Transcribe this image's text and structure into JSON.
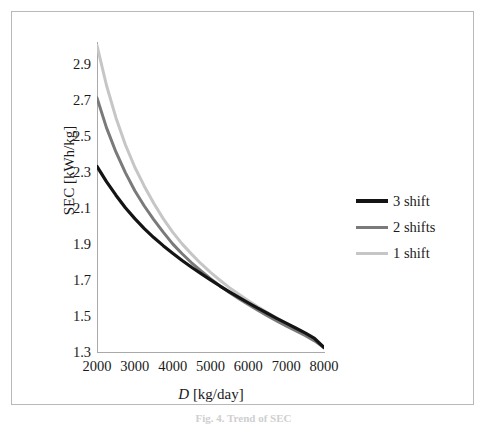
{
  "figure": {
    "caption": "Fig. 4. Trend of SEC"
  },
  "chart_data": {
    "type": "line",
    "title": "",
    "xlabel": "D [kg/day]",
    "xlabel_italic_symbol": "D",
    "xlabel_units": "[kg/day]",
    "ylabel": "SEC [kWh/kg]",
    "xlim": [
      2000,
      8000
    ],
    "ylim": [
      1.3,
      3.02
    ],
    "xticks": [
      2000,
      3000,
      4000,
      5000,
      6000,
      7000,
      8000
    ],
    "yticks": [
      1.3,
      1.5,
      1.7,
      1.9,
      2.1,
      2.3,
      2.5,
      2.7,
      2.9
    ],
    "xtick_labels": [
      "2000",
      "3000",
      "4000",
      "5000",
      "6000",
      "7000",
      "8000"
    ],
    "ytick_labels": [
      "1.3",
      "1.5",
      "1.7",
      "1.9",
      "2.1",
      "2.3",
      "2.5",
      "2.7",
      "2.9"
    ],
    "grid": false,
    "legend_position": "right-middle",
    "x": [
      2000,
      2250,
      2500,
      2750,
      3000,
      3250,
      3500,
      3750,
      4000,
      4250,
      4500,
      4750,
      5000,
      5250,
      5500,
      5750,
      6000,
      6250,
      6500,
      6750,
      7000,
      7250,
      7500,
      7750,
      8000
    ],
    "series": [
      {
        "name": "3 shift",
        "color": "#141414",
        "width": 3.2,
        "values": [
          2.33,
          2.245,
          2.17,
          2.1,
          2.04,
          1.985,
          1.935,
          1.89,
          1.848,
          1.808,
          1.77,
          1.735,
          1.7,
          1.666,
          1.634,
          1.603,
          1.573,
          1.543,
          1.515,
          1.487,
          1.46,
          1.433,
          1.406,
          1.375,
          1.325
        ]
      },
      {
        "name": "2 shifts",
        "color": "#7a7a7a",
        "width": 3.0,
        "values": [
          2.71,
          2.545,
          2.41,
          2.295,
          2.195,
          2.11,
          2.035,
          1.965,
          1.9,
          1.845,
          1.795,
          1.75,
          1.707,
          1.667,
          1.63,
          1.596,
          1.564,
          1.532,
          1.502,
          1.473,
          1.445,
          1.418,
          1.392,
          1.362,
          1.325
        ]
      },
      {
        "name": "1 shift",
        "color": "#c6c6c6",
        "width": 3.0,
        "values": [
          3.0,
          2.78,
          2.6,
          2.45,
          2.325,
          2.22,
          2.125,
          2.04,
          1.965,
          1.9,
          1.843,
          1.79,
          1.742,
          1.698,
          1.657,
          1.62,
          1.585,
          1.551,
          1.519,
          1.488,
          1.458,
          1.429,
          1.401,
          1.368,
          1.325
        ]
      }
    ],
    "legend": [
      {
        "label": "3 shift",
        "color": "#141414"
      },
      {
        "label": "2 shifts",
        "color": "#7a7a7a"
      },
      {
        "label": "1 shift",
        "color": "#c6c6c6"
      }
    ]
  }
}
